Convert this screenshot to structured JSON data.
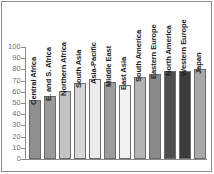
{
  "chart_data": {
    "type": "bar",
    "title": "",
    "subtitle": "",
    "xlabel": "",
    "ylabel": "",
    "ylim": [
      0,
      100
    ],
    "yticks": [
      0,
      10,
      20,
      30,
      40,
      50,
      60,
      70,
      80,
      90,
      100
    ],
    "ytick_labels": [
      "0",
      "10",
      "20",
      "30",
      "40",
      "50",
      "60",
      "70",
      "80",
      "90",
      "100"
    ],
    "grid": false,
    "legend": null,
    "orientation": "vertical",
    "label_rotation": 90,
    "categories": [
      "Central Africa",
      "E. and S. Africa",
      "Northern Africa",
      "South Asia",
      "Asia-Pacific",
      "Middle East",
      "East Asia",
      "South America",
      "Eastern Europe",
      "North America",
      "Western Europe",
      "Japan"
    ],
    "values": [
      53,
      56,
      61,
      68,
      71,
      69,
      66,
      73,
      76,
      79,
      79,
      80
    ],
    "bar_colors": [
      "#8f8f8f",
      "#9a9a9a",
      "#c2c2c2",
      "#d6d6d6",
      "#ececec",
      "#9c9c9c",
      "#f2f2f2",
      "#b4b4b4",
      "#8a8a8a",
      "#4e4e4e",
      "#3c3c3c",
      "#a8a8a8"
    ],
    "bars": [
      {
        "label": "Central Africa",
        "value": 53,
        "color": "#8f8f8f"
      },
      {
        "label": "E. and S. Africa",
        "value": 56,
        "color": "#9a9a9a"
      },
      {
        "label": "Northern Africa",
        "value": 61,
        "color": "#c2c2c2"
      },
      {
        "label": "South Asia",
        "value": 68,
        "color": "#d6d6d6"
      },
      {
        "label": "Asia-Pacific",
        "value": 71,
        "color": "#ececec"
      },
      {
        "label": "Middle East",
        "value": 69,
        "color": "#9c9c9c"
      },
      {
        "label": "East Asia",
        "value": 66,
        "color": "#f2f2f2"
      },
      {
        "label": "South America",
        "value": 73,
        "color": "#b4b4b4"
      },
      {
        "label": "Eastern Europe",
        "value": 76,
        "color": "#8a8a8a"
      },
      {
        "label": "North America",
        "value": 79,
        "color": "#4e4e4e"
      },
      {
        "label": "Western Europe",
        "value": 79,
        "color": "#3c3c3c"
      },
      {
        "label": "Japan",
        "value": 80,
        "color": "#a8a8a8"
      }
    ]
  },
  "style": {
    "axis_color": "#8a8a8a",
    "tick_label_color": "#6f6f6f",
    "category_label_color": "#1c1c1c",
    "frame_color": "#8c8c8c",
    "background": "#ffffff",
    "bar_edge_color": "#6b6b6b"
  }
}
